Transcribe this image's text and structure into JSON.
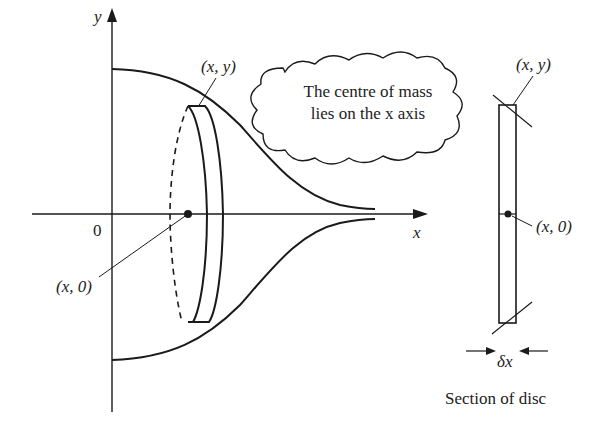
{
  "diagram": {
    "axes": {
      "y_label": "y",
      "x_label": "x",
      "origin_label": "0"
    },
    "labels": {
      "point_top": "(x, y)",
      "point_center": "(x, 0)",
      "section_point_top": "(x, y)",
      "section_point_center": "(x, 0)",
      "width_label": "δx",
      "section_caption": "Section of disc"
    },
    "callout": {
      "line1": "The centre of mass",
      "line2": "lies on the x axis"
    },
    "colors": {
      "stroke": "#1a1a1a",
      "text": "#222222",
      "background": "#ffffff"
    }
  }
}
